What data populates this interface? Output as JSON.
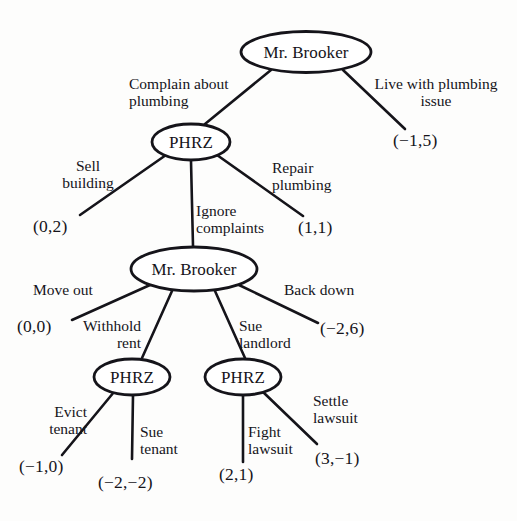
{
  "figure": {
    "kind": "game-tree",
    "ink_color": "#15141a",
    "background_color": "#fdfdfc"
  },
  "nodes": {
    "root": {
      "label": "Mr. Brooker",
      "player": "Mr. Brooker"
    },
    "phrz_top": {
      "label": "PHRZ",
      "player": "PHRZ"
    },
    "brooker_mid": {
      "label": "Mr. Brooker",
      "player": "Mr. Brooker"
    },
    "phrz_left": {
      "label": "PHRZ",
      "player": "PHRZ"
    },
    "phrz_right": {
      "label": "PHRZ",
      "player": "PHRZ"
    }
  },
  "edges": {
    "complain": "Complain about\nplumbing",
    "live_with": "Live with plumbing\nissue",
    "sell_building": "Sell\nbuilding",
    "ignore": "Ignore\ncomplaints",
    "repair": "Repair\nplumbing",
    "move_out": "Move out",
    "withhold": "Withhold\nrent",
    "sue_landlord": "Sue\nlandlord",
    "back_down": "Back down",
    "evict": "Evict\ntenant",
    "sue_tenant": "Sue\ntenant",
    "fight": "Fight\nlawsuit",
    "settle": "Settle\nlawsuit"
  },
  "payoffs": {
    "live_with": "(−1,5)",
    "sell_building": "(0,2)",
    "repair": "(1,1)",
    "move_out": "(0,0)",
    "back_down": "(−2,6)",
    "evict": "(−1,0)",
    "sue_tenant": "(−2,−2)",
    "fight": "(2,1)",
    "settle": "(3,−1)"
  }
}
